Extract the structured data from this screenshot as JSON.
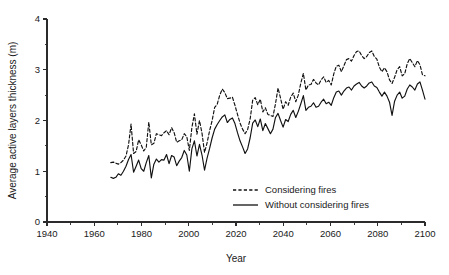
{
  "chart_data": {
    "type": "line",
    "title": "",
    "xlabel": "Year",
    "ylabel": "Average active layers thickness (m)",
    "xlim": [
      1940,
      2100
    ],
    "ylim": [
      0,
      4
    ],
    "grid": false,
    "legend_position": "inside-bottom-center",
    "x_ticks_major": [
      1940,
      1960,
      1980,
      2000,
      2020,
      2040,
      2060,
      2080,
      2100
    ],
    "x_ticks_minor": [
      1950,
      1970,
      1990,
      2010,
      2030,
      2050,
      2070,
      2090
    ],
    "y_ticks_major": [
      0,
      1,
      2,
      3,
      4
    ],
    "y_ticks_minor": [
      0.5,
      1.5,
      2.5,
      3.5
    ],
    "x_tick_labels": [
      "1940",
      "1960",
      "1980",
      "2000",
      "2020",
      "2040",
      "2060",
      "2080",
      "2100"
    ],
    "y_tick_labels": [
      "0",
      "1",
      "2",
      "3",
      "4"
    ],
    "x_start": 1967,
    "x_end": 2100,
    "series": [
      {
        "name": "Considering fires",
        "style": "dashed",
        "color": "#111111",
        "values": [
          1.17,
          1.18,
          1.16,
          1.14,
          1.17,
          1.22,
          1.3,
          1.52,
          1.93,
          1.35,
          1.39,
          1.62,
          1.52,
          1.4,
          1.47,
          1.97,
          1.52,
          1.55,
          1.74,
          1.72,
          1.7,
          1.76,
          1.8,
          1.72,
          1.86,
          1.76,
          1.57,
          1.6,
          1.62,
          1.74,
          1.68,
          1.41,
          1.86,
          2.13,
          1.73,
          2.0,
          1.75,
          1.37,
          1.56,
          1.8,
          2.0,
          2.26,
          2.32,
          2.5,
          2.62,
          2.55,
          2.43,
          2.44,
          2.46,
          2.3,
          2.12,
          1.95,
          1.83,
          1.74,
          1.82,
          2.03,
          2.4,
          2.45,
          2.31,
          2.42,
          2.17,
          2.25,
          2.12,
          2.1,
          2.08,
          2.33,
          2.64,
          2.44,
          2.22,
          2.37,
          2.3,
          2.46,
          2.54,
          2.37,
          2.5,
          2.74,
          2.93,
          2.6,
          2.7,
          2.71,
          2.81,
          2.74,
          2.7,
          2.8,
          2.86,
          2.75,
          2.79,
          2.7,
          2.92,
          3.07,
          3.09,
          2.96,
          3.08,
          3.2,
          3.22,
          3.17,
          3.28,
          3.36,
          3.37,
          3.28,
          3.22,
          3.26,
          3.34,
          3.37,
          3.26,
          3.21,
          3.05,
          2.96,
          3.04,
          2.96,
          2.8,
          2.73,
          2.85,
          3.0,
          3.06,
          2.88,
          2.92,
          3.12,
          3.22,
          3.14,
          3.06,
          3.18,
          3.1,
          2.9,
          2.88
        ]
      },
      {
        "name": "Without considering fires",
        "style": "solid",
        "color": "#111111",
        "values": [
          0.88,
          0.86,
          0.88,
          0.95,
          0.92,
          1.0,
          1.1,
          1.23,
          1.33,
          0.98,
          1.1,
          1.22,
          1.05,
          1.0,
          1.17,
          1.31,
          0.87,
          1.14,
          1.24,
          1.18,
          1.23,
          1.22,
          1.33,
          1.15,
          1.31,
          1.28,
          1.11,
          1.2,
          1.27,
          1.41,
          1.32,
          1.0,
          1.44,
          1.6,
          1.3,
          1.53,
          1.32,
          1.02,
          1.26,
          1.45,
          1.66,
          1.83,
          1.92,
          2.0,
          2.07,
          2.11,
          1.96,
          2.02,
          2.05,
          1.94,
          1.76,
          1.6,
          1.48,
          1.35,
          1.44,
          1.66,
          1.95,
          2.01,
          1.88,
          2.03,
          1.8,
          1.94,
          1.84,
          1.74,
          1.83,
          2.06,
          2.14,
          2.0,
          1.87,
          2.02,
          1.98,
          2.12,
          2.2,
          2.06,
          2.18,
          2.33,
          2.49,
          2.2,
          2.26,
          2.28,
          2.35,
          2.26,
          2.28,
          2.36,
          2.42,
          2.33,
          2.36,
          2.3,
          2.45,
          2.56,
          2.58,
          2.5,
          2.58,
          2.64,
          2.66,
          2.6,
          2.68,
          2.72,
          2.75,
          2.68,
          2.64,
          2.68,
          2.74,
          2.76,
          2.68,
          2.65,
          2.56,
          2.48,
          2.56,
          2.48,
          2.36,
          2.1,
          2.38,
          2.5,
          2.56,
          2.44,
          2.48,
          2.62,
          2.7,
          2.66,
          2.6,
          2.72,
          2.76,
          2.6,
          2.42
        ]
      }
    ],
    "legend": [
      {
        "label": "Considering fires",
        "style": "dashed"
      },
      {
        "label": "Without considering fires",
        "style": "solid"
      }
    ]
  }
}
